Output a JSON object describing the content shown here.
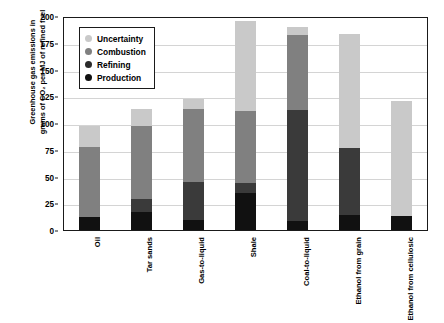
{
  "chart_data": {
    "type": "bar",
    "stacked": true,
    "title": "",
    "xlabel": "",
    "ylabel": "Greenhouse gas emissions in\ngrams of CO₂ per MJ of refined fuel",
    "ylim": [
      0,
      200
    ],
    "yticks": [
      0,
      25,
      50,
      75,
      100,
      125,
      150,
      175,
      200
    ],
    "grid": true,
    "legend_position": "top-left",
    "categories": [
      "Oil",
      "Tar sands",
      "Gas-to-liquid",
      "Shale",
      "Coal-to-liquid",
      "Ethanol from grain",
      "Ethanol from cellulosic"
    ],
    "series": [
      {
        "name": "Production",
        "color": "#111111",
        "values": [
          12,
          17,
          9,
          35,
          8,
          14,
          13
        ]
      },
      {
        "name": "Refining",
        "color": "#3a3a3a",
        "values": [
          0,
          12,
          36,
          9,
          104,
          63,
          0
        ]
      },
      {
        "name": "Combustion",
        "color": "#808080",
        "values": [
          66,
          68,
          68,
          67,
          70,
          0,
          0
        ]
      },
      {
        "name": "Uncertainty",
        "color": "#c9c9c9",
        "values": [
          19,
          16,
          9,
          84,
          8,
          106,
          108
        ]
      }
    ],
    "totals": [
      97,
      113,
      122,
      195,
      190,
      183,
      121
    ]
  },
  "legend": {
    "items": [
      {
        "label": "Uncertainty",
        "color": "#c9c9c9"
      },
      {
        "label": "Combustion",
        "color": "#808080"
      },
      {
        "label": "Refining",
        "color": "#2b2b2b"
      },
      {
        "label": "Production",
        "color": "#111111"
      }
    ]
  }
}
